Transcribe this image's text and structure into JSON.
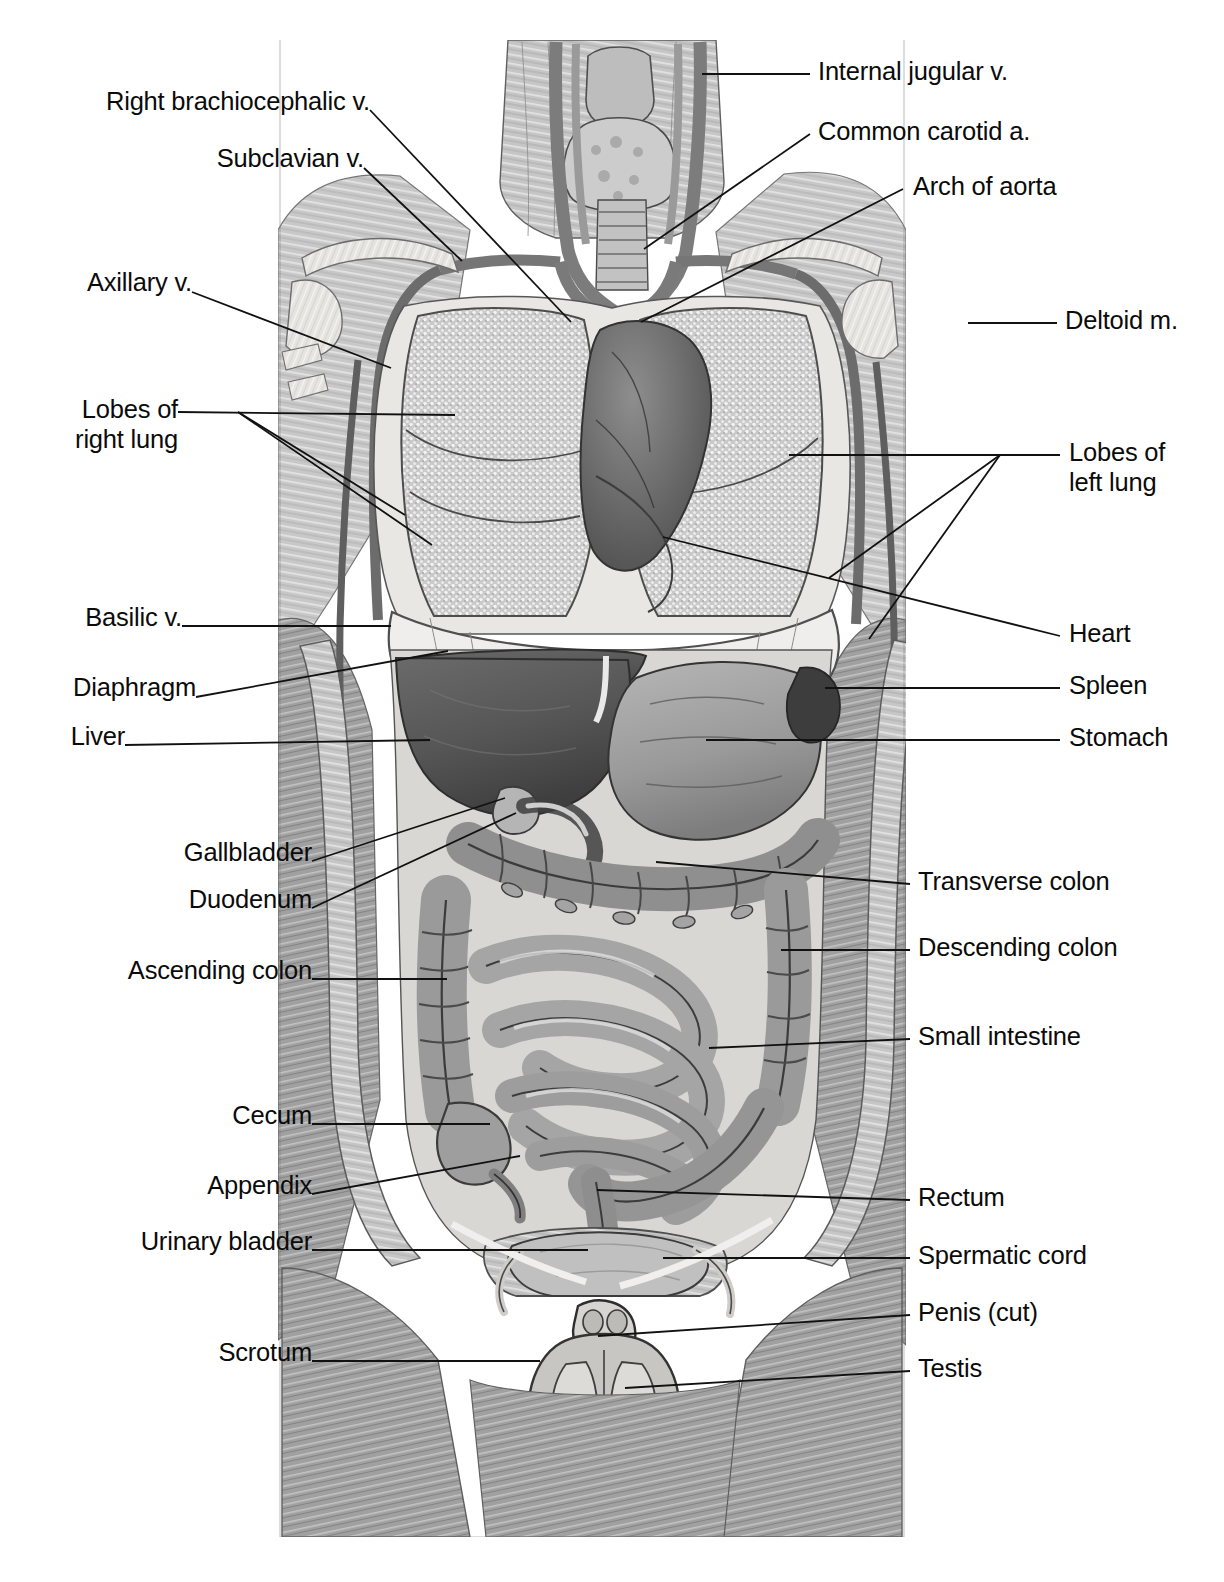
{
  "figure": {
    "type": "anatomical-illustration",
    "style": "grayscale-halftone-line-art",
    "background_color": "#ffffff",
    "ink_color": "#111111",
    "illustration_bounds": {
      "left": 278,
      "top": 30,
      "right": 906,
      "bottom": 1537
    }
  },
  "labels_left": [
    {
      "id": "right-brachiocephalic-v",
      "text": "Right brachiocephalic v.",
      "x": 110,
      "y": 86,
      "anchor_x": 370,
      "anchor_y": 110,
      "target_x": 571,
      "target_y": 322
    },
    {
      "id": "subclavian-v",
      "text": "Subclavian v.",
      "x": 221,
      "y": 143,
      "anchor_x": 364,
      "anchor_y": 168,
      "target_x": 462,
      "target_y": 261
    },
    {
      "id": "axillary-v",
      "text": "Axillary v.",
      "x": 47,
      "y": 267,
      "anchor_x": 192,
      "anchor_y": 292,
      "target_x": 391,
      "target_y": 368
    },
    {
      "id": "lobes-of-right-lung",
      "text": "Lobes of\nright lung",
      "x": 47,
      "y": 394,
      "anchor_x": 178,
      "anchor_y": 412,
      "target_x": 455,
      "target_y": 415,
      "target2_x": 405,
      "target2_y": 515,
      "target3_x": 432,
      "target3_y": 545
    },
    {
      "id": "basilic-v",
      "text": "Basilic v.",
      "x": 47,
      "y": 602,
      "anchor_x": 182,
      "anchor_y": 626,
      "target_x": 391,
      "target_y": 626
    },
    {
      "id": "diaphragm",
      "text": "Diaphragm",
      "x": 47,
      "y": 672,
      "anchor_x": 196,
      "anchor_y": 697,
      "target_x": 448,
      "target_y": 651
    },
    {
      "id": "liver",
      "text": "Liver",
      "x": 47,
      "y": 721,
      "anchor_x": 125,
      "anchor_y": 745,
      "target_x": 430,
      "target_y": 740
    },
    {
      "id": "gallbladder",
      "text": "Gallbladder",
      "x": 143,
      "y": 837,
      "anchor_x": 312,
      "anchor_y": 861,
      "target_x": 505,
      "target_y": 798
    },
    {
      "id": "duodenum",
      "text": "Duodenum",
      "x": 148,
      "y": 884,
      "anchor_x": 312,
      "anchor_y": 908,
      "target_x": 516,
      "target_y": 813
    },
    {
      "id": "ascending-colon",
      "text": "Ascending colon",
      "x": 89,
      "y": 955,
      "anchor_x": 312,
      "anchor_y": 979,
      "target_x": 447,
      "target_y": 979
    },
    {
      "id": "cecum",
      "text": "Cecum",
      "x": 189,
      "y": 1100,
      "anchor_x": 312,
      "anchor_y": 1124,
      "target_x": 490,
      "target_y": 1124
    },
    {
      "id": "appendix",
      "text": "Appendix",
      "x": 165,
      "y": 1170,
      "anchor_x": 312,
      "anchor_y": 1194,
      "target_x": 520,
      "target_y": 1156
    },
    {
      "id": "urinary-bladder",
      "text": "Urinary bladder",
      "x": 99,
      "y": 1226,
      "anchor_x": 312,
      "anchor_y": 1250,
      "target_x": 588,
      "target_y": 1250
    },
    {
      "id": "scrotum",
      "text": "Scrotum",
      "x": 171,
      "y": 1337,
      "anchor_x": 312,
      "anchor_y": 1361,
      "target_x": 540,
      "target_y": 1361
    }
  ],
  "labels_right": [
    {
      "id": "internal-jugular-v",
      "text": "Internal jugular v.",
      "x": 818,
      "y": 56,
      "anchor_x": 810,
      "anchor_y": 74,
      "target_x": 702,
      "target_y": 74
    },
    {
      "id": "common-carotid-a",
      "text": "Common carotid a.",
      "x": 818,
      "y": 116,
      "anchor_x": 810,
      "anchor_y": 134,
      "target_x": 644,
      "target_y": 249
    },
    {
      "id": "arch-of-aorta",
      "text": "Arch of aorta",
      "x": 913,
      "y": 171,
      "anchor_x": 903,
      "anchor_y": 189,
      "target_x": 641,
      "target_y": 322
    },
    {
      "id": "deltoid-m",
      "text": "Deltoid m.",
      "x": 1065,
      "y": 305,
      "anchor_x": 1057,
      "anchor_y": 323,
      "target_x": 968,
      "target_y": 323
    },
    {
      "id": "lobes-of-left-lung",
      "text": "Lobes of\nleft lung",
      "x": 1069,
      "y": 437,
      "anchor_x": 1060,
      "anchor_y": 455,
      "target_x": 789,
      "target_y": 455,
      "target2_x": 829,
      "target2_y": 578,
      "target3_x": 869,
      "target3_y": 639
    },
    {
      "id": "heart",
      "text": "Heart",
      "x": 1069,
      "y": 618,
      "anchor_x": 1060,
      "anchor_y": 636,
      "target_x": 663,
      "target_y": 537
    },
    {
      "id": "spleen",
      "text": "Spleen",
      "x": 1069,
      "y": 670,
      "anchor_x": 1060,
      "anchor_y": 688,
      "target_x": 825,
      "target_y": 688
    },
    {
      "id": "stomach",
      "text": "Stomach",
      "x": 1069,
      "y": 722,
      "anchor_x": 1060,
      "anchor_y": 740,
      "target_x": 706,
      "target_y": 740
    },
    {
      "id": "transverse-colon",
      "text": "Transverse colon",
      "x": 918,
      "y": 866,
      "anchor_x": 910,
      "anchor_y": 884,
      "target_x": 656,
      "target_y": 862
    },
    {
      "id": "descending-colon",
      "text": "Descending colon",
      "x": 918,
      "y": 932,
      "anchor_x": 910,
      "anchor_y": 950,
      "target_x": 781,
      "target_y": 950
    },
    {
      "id": "small-intestine",
      "text": "Small intestine",
      "x": 918,
      "y": 1021,
      "anchor_x": 910,
      "anchor_y": 1039,
      "target_x": 709,
      "target_y": 1048
    },
    {
      "id": "rectum",
      "text": "Rectum",
      "x": 918,
      "y": 1182,
      "anchor_x": 910,
      "anchor_y": 1200,
      "target_x": 597,
      "target_y": 1190
    },
    {
      "id": "spermatic-cord",
      "text": "Spermatic cord",
      "x": 918,
      "y": 1240,
      "anchor_x": 910,
      "anchor_y": 1258,
      "target_x": 663,
      "target_y": 1258
    },
    {
      "id": "penis-cut",
      "text": "Penis (cut)",
      "x": 918,
      "y": 1297,
      "anchor_x": 910,
      "anchor_y": 1315,
      "target_x": 598,
      "target_y": 1336
    },
    {
      "id": "testis",
      "text": "Testis",
      "x": 918,
      "y": 1353,
      "anchor_x": 910,
      "anchor_y": 1371,
      "target_x": 625,
      "target_y": 1388
    }
  ]
}
